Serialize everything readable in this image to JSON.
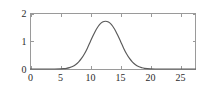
{
  "chart_data": {
    "type": "line",
    "title": "",
    "subtitle": "",
    "xlabel": "",
    "ylabel": "",
    "xlim": [
      0,
      27.5
    ],
    "ylim": [
      0,
      2
    ],
    "grid": false,
    "legend": null,
    "legend_position": "none",
    "frame": "box",
    "curve_color": "#5a5a5a",
    "axis_color": "#9a9a9a",
    "background": "#ffffff",
    "x_ticks": [
      0,
      5,
      10,
      15,
      20,
      25
    ],
    "x_tick_labels": [
      "0",
      "5",
      "10",
      "15",
      "20",
      "25"
    ],
    "y_ticks": [
      0,
      1,
      2
    ],
    "y_tick_labels": [
      "0",
      "1",
      "2"
    ],
    "peak": {
      "x": 12.5,
      "y": 1.72
    },
    "series": [
      {
        "name": "curve",
        "x": [
          0,
          1,
          2,
          3,
          4,
          5,
          5.5,
          6,
          6.5,
          7,
          7.5,
          8,
          8.5,
          9,
          9.5,
          10,
          10.5,
          11,
          11.5,
          12,
          12.5,
          13,
          13.5,
          14,
          14.5,
          15,
          15.5,
          16,
          16.5,
          17,
          17.5,
          18,
          18.5,
          19,
          20,
          21,
          22,
          23,
          24,
          25,
          26,
          27.5
        ],
        "values": [
          0,
          0,
          0,
          0,
          0.001,
          0.005,
          0.012,
          0.025,
          0.05,
          0.09,
          0.155,
          0.25,
          0.38,
          0.55,
          0.76,
          1.0,
          1.23,
          1.44,
          1.6,
          1.69,
          1.72,
          1.69,
          1.6,
          1.44,
          1.23,
          1.0,
          0.76,
          0.55,
          0.38,
          0.25,
          0.155,
          0.09,
          0.05,
          0.025,
          0.005,
          0.001,
          0,
          0,
          0,
          0,
          0,
          0
        ]
      }
    ]
  }
}
